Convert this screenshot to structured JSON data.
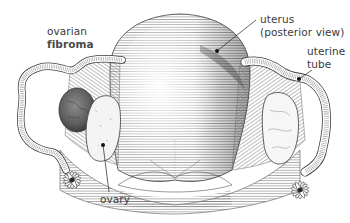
{
  "figure": {
    "colors": {
      "background": "#ffffff",
      "line_art": "#3c3c3c",
      "label_text": "#3a3a3a",
      "fibroma_fill": "#6e6e6e"
    }
  },
  "labels": {
    "ovarian_fibroma": {
      "line1": "ovarian",
      "line2": "fibroma"
    },
    "uterus": {
      "line1": "uterus",
      "line2": "(posterior view)"
    },
    "uterine_tube": {
      "line1": "uterine",
      "line2": "tube"
    },
    "ovary": {
      "line1": "ovary"
    }
  }
}
